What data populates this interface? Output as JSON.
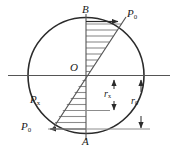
{
  "figure": {
    "type": "engineering-diagram",
    "colors": {
      "stroke": "#2b2b2b",
      "hatch": "#8c8c8c",
      "background": "#ffffff",
      "text": "#1a1a1a"
    },
    "geometry": {
      "circle": {
        "cx": 86,
        "cy": 75.5,
        "r": 58
      },
      "vertical_axis": {
        "x": 86,
        "y_top": 14,
        "y_bottom": 140
      },
      "horizontal_axis": {
        "y": 75.5,
        "x_left": 8,
        "x_right": 170
      },
      "pressure_line": {
        "x1": 52,
        "y1": 130,
        "x2": 124,
        "y2": 20
      }
    },
    "labels": {
      "point_top": "B",
      "point_bottom": "A",
      "origin": "O",
      "pressure_top": {
        "base": "P",
        "sub": "0"
      },
      "pressure_bottom": {
        "base": "P",
        "sub": "0"
      },
      "pressure_x": {
        "base": "P",
        "sub": "x"
      },
      "radius_x": {
        "base": "r",
        "sub": "x"
      },
      "radius_0": {
        "base": "r",
        "sub": "0"
      }
    },
    "hatch": {
      "upper_count": 9,
      "lower_count": 8,
      "description": "horizontal hatch lines between the vertical axis and the inclined pressure line"
    },
    "dimensions": {
      "radius_x_arrow": {
        "x": 114,
        "y_top": 80,
        "y_bottom": 116
      },
      "radius_0_arrow": {
        "x": 140,
        "y_top": 80,
        "y_bottom": 132
      }
    }
  }
}
